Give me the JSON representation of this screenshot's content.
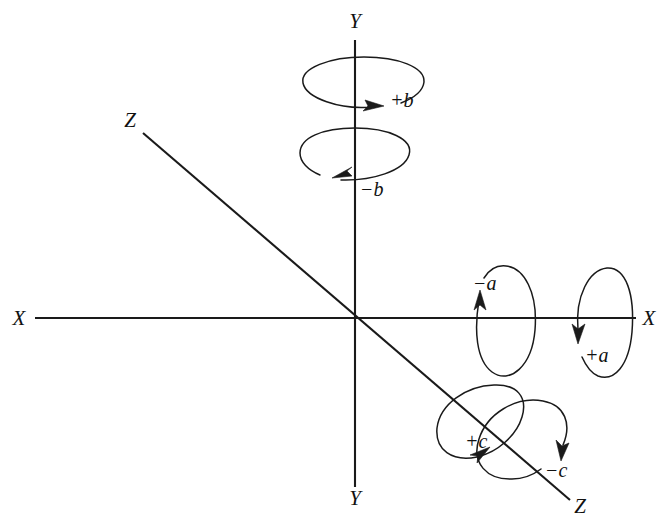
{
  "figure": {
    "type": "technical-diagram",
    "background_color": "#ffffff",
    "line_color": "#1a1a1a",
    "origin": {
      "x": 355,
      "y": 318
    }
  },
  "axes": [
    {
      "name": "x-axis",
      "orientation": "horizontal",
      "label_negative_end": "X",
      "label_positive_end": "X",
      "start": {
        "x": 35,
        "y": 318
      },
      "end": {
        "x": 636,
        "y": 318
      }
    },
    {
      "name": "y-axis",
      "orientation": "vertical",
      "label_top_end": "Y",
      "label_bottom_end": "Y",
      "start": {
        "x": 355,
        "y": 40
      },
      "end": {
        "x": 355,
        "y": 487
      }
    },
    {
      "name": "z-axis",
      "orientation": "diagonal",
      "label_upper_end": "Z",
      "label_lower_end": "Z",
      "start": {
        "x": 143,
        "y": 133
      },
      "end": {
        "x": 570,
        "y": 500
      }
    }
  ],
  "axis_end_labels": [
    {
      "name": "y-top",
      "text": "Y",
      "x": 355,
      "y": 28
    },
    {
      "name": "y-bottom",
      "text": "Y",
      "x": 355,
      "y": 505
    },
    {
      "name": "x-left",
      "text": "X",
      "x": 19,
      "y": 325
    },
    {
      "name": "x-right",
      "text": "X",
      "x": 649,
      "y": 325
    },
    {
      "name": "z-upper-left",
      "text": "Z",
      "x": 130,
      "y": 127
    },
    {
      "name": "z-lower-right",
      "text": "Z",
      "x": 580,
      "y": 513
    }
  ],
  "rotations": [
    {
      "name": "plus-b",
      "label": "+b",
      "axis": "y-axis",
      "sense": "clockwise-viewed-from-above",
      "label_x": 390,
      "label_y": 107
    },
    {
      "name": "minus-b",
      "label": "−b",
      "axis": "y-axis",
      "sense": "counterclockwise-viewed-from-above",
      "label_x": 360,
      "label_y": 196
    },
    {
      "name": "minus-a",
      "label": "−a",
      "axis": "x-axis",
      "sense": "arrow-up-on-near-side",
      "label_x": 473,
      "label_y": 290
    },
    {
      "name": "plus-a",
      "label": "+a",
      "axis": "x-axis",
      "sense": "arrow-down-on-near-side",
      "label_x": 585,
      "label_y": 362
    },
    {
      "name": "plus-c",
      "label": "+c",
      "axis": "z-axis",
      "sense": "arrow-up-right-on-near-side",
      "label_x": 465,
      "label_y": 448
    },
    {
      "name": "minus-c",
      "label": "−c",
      "axis": "z-axis",
      "sense": "arrow-down-on-far-side",
      "label_x": 545,
      "label_y": 477
    }
  ]
}
